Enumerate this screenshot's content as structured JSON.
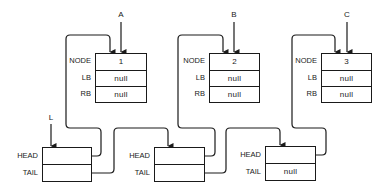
{
  "pointers": {
    "A": "A",
    "B": "B",
    "C": "C",
    "L": "L"
  },
  "field_labels": {
    "node": "NODE",
    "lb": "LB",
    "rb": "RB",
    "head": "HEAD",
    "tail": "TAIL"
  },
  "nodes": [
    {
      "node": "1",
      "lb": "null",
      "rb": "null"
    },
    {
      "node": "2",
      "lb": "null",
      "rb": "null"
    },
    {
      "node": "3",
      "lb": "null",
      "rb": "null"
    }
  ],
  "list_cells": [
    {
      "head": "",
      "tail": ""
    },
    {
      "head": "",
      "tail": ""
    },
    {
      "head": "",
      "tail": "null"
    }
  ],
  "colors": {
    "line": "#1a1a1a",
    "background": "#ffffff"
  }
}
